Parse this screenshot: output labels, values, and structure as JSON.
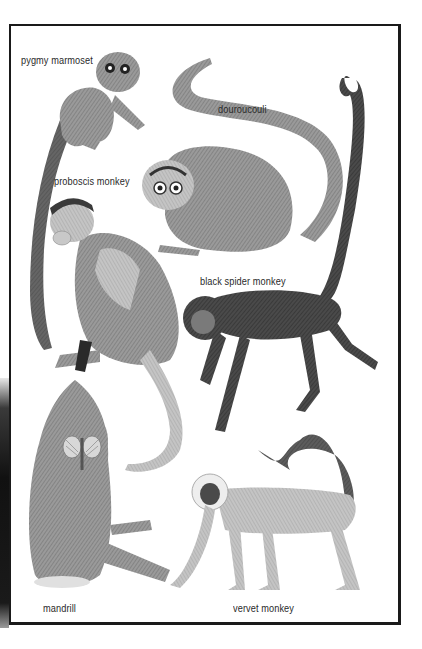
{
  "plate": {
    "title": "",
    "labels": {
      "pygmy_marmoset": "pygmy marmoset",
      "douroucouli": "douroucouli",
      "proboscis_monkey": "proboscis monkey",
      "black_spider_monkey": "black spider monkey",
      "mandrill": "mandrill",
      "vervet_monkey": "vervet monkey"
    },
    "colors": {
      "border": "#1a1a1a",
      "label": "#2a2a2a",
      "fur_light": "#b8b8b8",
      "fur_mid": "#8a8a8a",
      "fur_dark": "#3a3a3a",
      "background": "#ffffff"
    }
  }
}
